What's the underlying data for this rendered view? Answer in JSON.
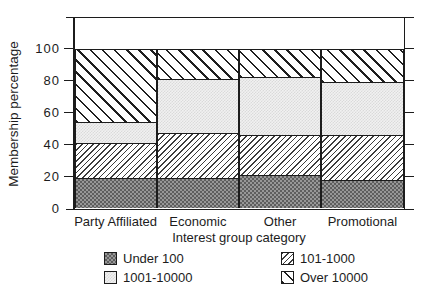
{
  "window": {
    "width": 432,
    "height": 304,
    "background": "#ffffff"
  },
  "chart_data": {
    "type": "bar",
    "stacked": true,
    "orientation": "vertical",
    "title": "",
    "xlabel": "Interest group category",
    "ylabel": "Membership percentage",
    "categories": [
      "Party Affiliated",
      "Economic",
      "Other",
      "Promotional"
    ],
    "series": [
      {
        "name": "Under 100",
        "pattern": "dark-gray-checker",
        "values": [
          19,
          19,
          21,
          18
        ]
      },
      {
        "name": "101-1000",
        "pattern": "thin-forward-diagonal-hatch",
        "values": [
          22,
          28,
          25,
          28
        ]
      },
      {
        "name": "1001-10000",
        "pattern": "light-gray-checker",
        "values": [
          13,
          34,
          36,
          33
        ]
      },
      {
        "name": "Over 10000",
        "pattern": "bold-backward-diagonal-hatch",
        "values": [
          46,
          19,
          18,
          21
        ]
      }
    ],
    "yticks": [
      0,
      20,
      40,
      60,
      80,
      100
    ],
    "ylim": [
      0,
      120
    ],
    "grid": false,
    "legend_position": "below-chart",
    "legend_layout": [
      [
        "Under 100",
        "101-1000"
      ],
      [
        "1001-10000",
        "Over 10000"
      ]
    ]
  },
  "colors": {
    "ink": "#1c1c1c",
    "dark_fill": "#979797",
    "dark_check": "#5e5e5e",
    "light_fill": "#f1f1f1",
    "light_check": "#dadada",
    "hatch_line": "#333333",
    "background": "#ffffff"
  }
}
